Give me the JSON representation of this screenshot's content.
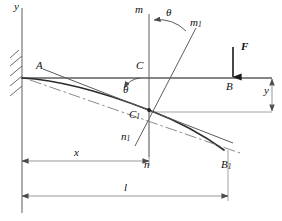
{
  "figure": {
    "type": "engineering-diagram",
    "background_color": "#ffffff",
    "line_color": "#555555",
    "curve_color": "#303030",
    "text_color": "#101010"
  },
  "axes": {
    "y_axis_label": "y",
    "y_axis_label_position": {
      "x": 14,
      "y": 2
    },
    "vertical_axis": {
      "x": 22,
      "y_top": 8,
      "y_bottom": 213
    },
    "horizontal_beam_axis": {
      "y": 78,
      "x_start": 22,
      "x_end": 272
    }
  },
  "support": {
    "name": "fixed-wall-hatching",
    "hatch_count": 5,
    "x": 22,
    "y_top": 52,
    "y_bottom": 96
  },
  "points": [
    {
      "id": "A",
      "label": "A",
      "lx": 36,
      "ly": 61,
      "size": "s11"
    },
    {
      "id": "C",
      "label": "C",
      "lx": 136,
      "ly": 61,
      "size": "s11"
    },
    {
      "id": "B",
      "label": "B",
      "lx": 226,
      "ly": 82,
      "size": "s11"
    },
    {
      "id": "C1",
      "label": "C",
      "sub": "1",
      "lx": 131,
      "ly": 110,
      "size": "s11"
    },
    {
      "id": "B1",
      "label": "B",
      "sub": "1",
      "lx": 222,
      "ly": 160,
      "size": "s11"
    }
  ],
  "section_line": {
    "name": "cross-section-mn",
    "top_label": "m",
    "bottom_label": "n",
    "top_label_pos": {
      "x": 135,
      "y": 5
    },
    "bottom_label_pos": {
      "x": 144,
      "y": 160
    },
    "x": 149,
    "y_top": 14,
    "y_bottom": 157
  },
  "rotated_section_line": {
    "name": "rotated-cross-section-m1n1",
    "top_label": "m",
    "top_sub": "1",
    "bottom_label": "n",
    "bottom_sub": "1",
    "top_label_pos": {
      "x": 190,
      "y": 18
    },
    "bottom_label_pos": {
      "x": 123,
      "y": 132
    }
  },
  "angles": [
    {
      "name": "theta-top",
      "label": "θ",
      "lx": 167,
      "ly": 8,
      "size": "s11"
    },
    {
      "name": "theta-beam",
      "label": "θ",
      "lx": 124,
      "ly": 85,
      "size": "s11"
    }
  ],
  "force": {
    "name": "applied-force-F",
    "label": "F",
    "label_pos": {
      "x": 242,
      "y": 42
    },
    "arrow_x": 233,
    "arrow_y_top": 47,
    "arrow_y_bottom": 78,
    "direction": "down"
  },
  "dimensions": [
    {
      "id": "deflection-y",
      "label": "y",
      "label_pos": {
        "x": 266,
        "y": 86
      },
      "orientation": "vertical",
      "x": 272,
      "y_from": 78,
      "y_to": 112
    },
    {
      "id": "distance-x",
      "label": "x",
      "label_pos": {
        "x": 74,
        "y": 148
      },
      "orientation": "horizontal",
      "y": 161,
      "x_from": 22,
      "x_to": 149
    },
    {
      "id": "length-l",
      "label": "l",
      "label_pos": {
        "x": 124,
        "y": 183
      },
      "orientation": "horizontal",
      "y": 196,
      "x_from": 22,
      "x_to": 228
    }
  ],
  "curves": {
    "deflected_beam": {
      "name": "deflected-beam-curve",
      "path": "M 22,78 C 60,80 105,93 149,110 C 180,122 205,136 224,150"
    },
    "tangent_line": {
      "name": "tangent-at-C1",
      "from": {
        "x": 43,
        "y": 70
      },
      "to": {
        "x": 232,
        "y": 142
      }
    },
    "chain_dash_line": {
      "name": "chain-dash-centerline",
      "from": {
        "x": 30,
        "y": 80
      },
      "to": {
        "x": 238,
        "y": 152
      }
    }
  }
}
